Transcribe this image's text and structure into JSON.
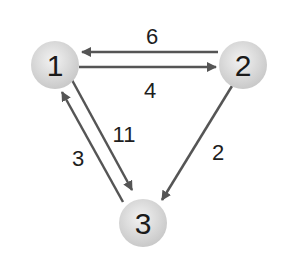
{
  "graph": {
    "nodes": [
      {
        "id": "1",
        "label": "1",
        "x": 55,
        "y": 65
      },
      {
        "id": "2",
        "label": "2",
        "x": 243,
        "y": 65
      },
      {
        "id": "3",
        "label": "3",
        "x": 143,
        "y": 223
      }
    ],
    "edges": [
      {
        "from": "2",
        "to": "1",
        "weight": "6"
      },
      {
        "from": "1",
        "to": "2",
        "weight": "4"
      },
      {
        "from": "1",
        "to": "3",
        "weight": "11"
      },
      {
        "from": "3",
        "to": "1",
        "weight": "3"
      },
      {
        "from": "2",
        "to": "3",
        "weight": "2"
      }
    ],
    "colors": {
      "edge": "#555555",
      "node_fill": "#dcdcdc",
      "text": "#1e1e1e"
    }
  }
}
